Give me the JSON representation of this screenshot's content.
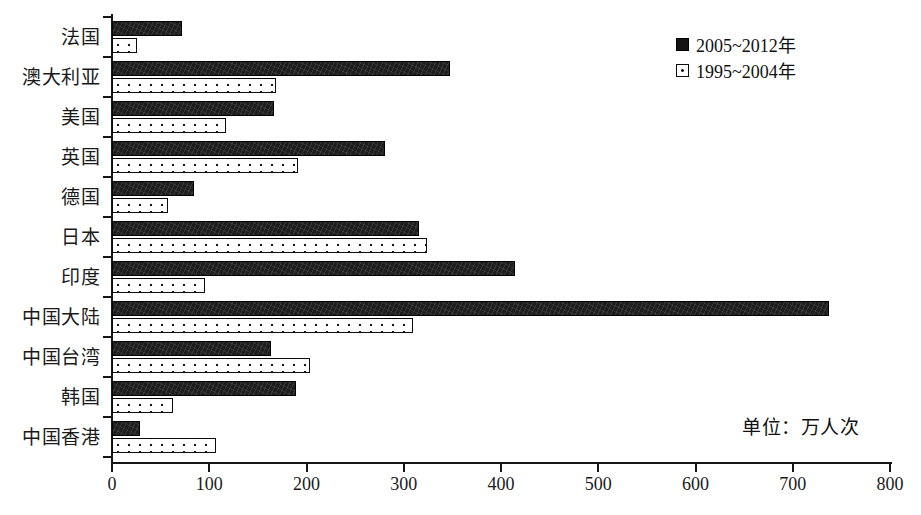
{
  "chart_data": {
    "type": "bar",
    "orientation": "horizontal",
    "title": "",
    "subtitle": "",
    "xlabel": "",
    "ylabel": "",
    "unit_note": "单位：万人次",
    "xlim": [
      0,
      800
    ],
    "xticks": [
      0,
      100,
      200,
      300,
      400,
      500,
      600,
      700,
      800
    ],
    "xtick_labels": [
      "0",
      "100",
      "200",
      "300",
      "400",
      "500",
      "600",
      "700",
      "800"
    ],
    "grid": false,
    "legend_position": "top-right",
    "categories": [
      "法国",
      "澳大利亚",
      "美国",
      "英国",
      "德国",
      "日本",
      "印度",
      "中国大陆",
      "中国台湾",
      "韩国",
      "中国香港"
    ],
    "series": [
      {
        "name": "2005~2012年",
        "style": "solid-dark",
        "color": "#1d1d1d",
        "values": [
          72,
          348,
          167,
          281,
          84,
          316,
          414,
          737,
          164,
          189,
          29
        ]
      },
      {
        "name": "1995~2004年",
        "style": "white-dotted",
        "color": "#ffffff",
        "values": [
          26,
          169,
          117,
          191,
          58,
          324,
          96,
          309,
          204,
          63,
          107
        ]
      }
    ]
  },
  "legend": {
    "items": [
      {
        "label": "2005~2012年",
        "swatch": "solid-dark-square"
      },
      {
        "label": "1995~2004年",
        "swatch": "dotted-white-square"
      }
    ]
  }
}
